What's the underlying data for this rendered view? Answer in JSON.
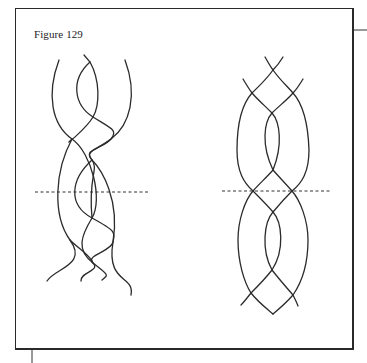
{
  "figure": {
    "title": "Figure 129",
    "stroke_color": "#2b2b2b",
    "frame_color": "#2a2a2a"
  },
  "diagrams": {
    "left_braid": {
      "strands": [
        "M59,60 C46,95 52,125 72,139 S103,200 92,218 S76,250 93,263 S108,275 102,280",
        "M84,55 L90,62 C100,80 100,105 93,117 S60,150 72,139",
        "M90,62 C70,80 74,105 93,117 S118,130 111,139 S82,150 92,160 S120,200 113,242 S135,275 131,295",
        "M125,60 C138,95 130,125 111,139 S85,150 92,160 S88,175 92,218",
        "M92,160 C70,180 68,205 92,218 S115,232 113,242 S85,255 93,263 S80,272 81,281",
        "M72,139 C55,170 52,215 70,240 S55,268 47,281",
        "M70,240 C80,250 90,255 93,263"
      ],
      "dashed_line": {
        "x1": 35,
        "y1": 192,
        "x2": 150,
        "y2": 192
      }
    },
    "right_braid": {
      "strands": [
        "M265,57 C268,62 270,66 273,70 C280,80 287,86 293,93 C302,103 308,120 309,150 C309,172 302,183 292,191 C283,200 278,206 273,212",
        "M283,57 C280,62 277,66 273,70 C266,80 259,86 252,93 C243,103 237,120 237,150 C237,172 244,183 253,191 C262,200 268,206 273,212",
        "M243,79 C246,84 249,89 252,93 C258,100 265,106 272,113 C280,122 283,145 273,170 C266,178 259,184 253,191 C245,200 238,220 238,240 C238,262 244,282 251,293 C258,302 266,308 273,314",
        "M303,79 C300,84 297,89 293,93 C287,100 279,106 272,113 C264,122 261,145 273,170 C280,178 286,184 292,191 C300,200 308,220 308,240 C308,262 302,282 293,295 C286,303 279,309 273,314",
        "M273,212 C282,222 285,250 272,270 C265,279 258,286 251,293 C247,298 244,302 241,305",
        "M273,212 C264,222 261,250 272,270 C279,279 286,287 293,295 C295,299 297,303 298,306"
      ],
      "dashed_line": {
        "x1": 222,
        "y1": 191,
        "x2": 332,
        "y2": 191
      }
    }
  },
  "frame_ticks": {
    "right": {
      "x1": 354,
      "y1": 30,
      "x2": 367,
      "y2": 30
    },
    "bottom": {
      "x1": 32,
      "y1": 350,
      "x2": 32,
      "y2": 363
    }
  }
}
